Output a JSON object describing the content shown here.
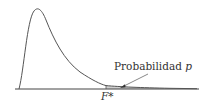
{
  "diagram": {
    "type": "F-distribution density curve with shaded upper tail",
    "labels": {
      "probability_text": "Probabilidad",
      "probability_symbol": "p",
      "critical_value": "F*"
    },
    "colors": {
      "curve": "#555555",
      "axis": "#444444",
      "shade": "#cfcfcf",
      "text": "#333333"
    }
  }
}
